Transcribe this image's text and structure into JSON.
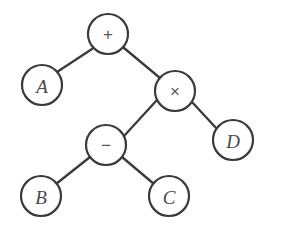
{
  "diagram": {
    "expression": "A + ((B - C) * D)",
    "background_color": "#ffffff",
    "stroke_color": "#3a3a3a",
    "operand_text_color": "#4a4a4a",
    "operator_text_color": "#5a5a5a",
    "node_radius": 20,
    "width": 281,
    "height": 233
  },
  "nodes": [
    {
      "id": "root",
      "label": "+",
      "kind": "operator",
      "cx": 108,
      "cy": 34,
      "r": 20
    },
    {
      "id": "a",
      "label": "A",
      "kind": "operand",
      "cx": 42,
      "cy": 85,
      "r": 20
    },
    {
      "id": "times",
      "label": "×",
      "kind": "operator",
      "cx": 175,
      "cy": 91,
      "r": 20
    },
    {
      "id": "minus",
      "label": "−",
      "kind": "operator",
      "cx": 106,
      "cy": 145,
      "r": 20
    },
    {
      "id": "d",
      "label": "D",
      "kind": "operand",
      "cx": 233,
      "cy": 140,
      "r": 20
    },
    {
      "id": "b",
      "label": "B",
      "kind": "operand",
      "cx": 41,
      "cy": 196,
      "r": 20
    },
    {
      "id": "c",
      "label": "C",
      "kind": "operand",
      "cx": 169,
      "cy": 196,
      "r": 20
    }
  ],
  "edges": [
    {
      "id": "edge-root-a",
      "from": "root",
      "to": "a",
      "x1": 92,
      "y1": 49,
      "x2": 57,
      "y2": 72
    },
    {
      "id": "edge-root-times",
      "from": "root",
      "to": "times",
      "x1": 124,
      "y1": 48,
      "x2": 160,
      "y2": 78
    },
    {
      "id": "edge-times-minus",
      "from": "times",
      "to": "minus",
      "x1": 157,
      "y1": 100,
      "x2": 124,
      "y2": 136
    },
    {
      "id": "edge-times-d",
      "from": "times",
      "to": "d",
      "x1": 192,
      "y1": 102,
      "x2": 217,
      "y2": 129
    },
    {
      "id": "edge-minus-b",
      "from": "minus",
      "to": "b",
      "x1": 90,
      "y1": 157,
      "x2": 56,
      "y2": 184
    },
    {
      "id": "edge-minus-c",
      "from": "minus",
      "to": "c",
      "x1": 122,
      "y1": 157,
      "x2": 154,
      "y2": 184
    }
  ]
}
